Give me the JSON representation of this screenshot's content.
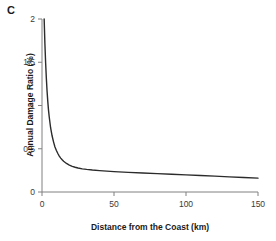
{
  "panel": {
    "label": "C"
  },
  "chart_data": {
    "type": "line",
    "title": "",
    "subtitle": "",
    "panel_label": "C",
    "xlabel": "Distance from the Coast (km)",
    "ylabel": "Annual Damage Ratio (%)",
    "xlim": [
      0,
      150
    ],
    "ylim": [
      0,
      2
    ],
    "xticks": [
      0,
      50,
      100,
      150
    ],
    "xtick_labels": [
      "0",
      "50",
      "100",
      "150"
    ],
    "yticks": [
      0,
      0.5,
      1,
      1.5,
      2
    ],
    "ytick_labels": [
      "0",
      "0.5",
      "1",
      "1.5",
      "2"
    ],
    "grid": false,
    "legend": false,
    "legend_position": "none",
    "line_color": "#2b2b2b",
    "axis_color": "#808080",
    "series": [
      {
        "name": "Annual Damage Ratio",
        "x": [
          1.5,
          2,
          2.5,
          3,
          3.5,
          4,
          4.5,
          5,
          6,
          7,
          8,
          9,
          10,
          11,
          12,
          13,
          14,
          15,
          17,
          19,
          21,
          23,
          25,
          28,
          31,
          35,
          40,
          45,
          50,
          60,
          70,
          80,
          90,
          100,
          110,
          120,
          130,
          140,
          150
        ],
        "values": [
          2.0,
          1.72,
          1.5,
          1.32,
          1.17,
          1.05,
          0.95,
          0.87,
          0.74,
          0.65,
          0.58,
          0.52,
          0.48,
          0.445,
          0.415,
          0.392,
          0.372,
          0.355,
          0.33,
          0.311,
          0.297,
          0.286,
          0.278,
          0.268,
          0.261,
          0.254,
          0.247,
          0.241,
          0.236,
          0.227,
          0.22,
          0.212,
          0.205,
          0.198,
          0.19,
          0.183,
          0.175,
          0.168,
          0.16
        ]
      }
    ]
  }
}
